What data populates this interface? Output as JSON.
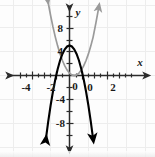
{
  "figure": {
    "name": "coordinate-plane-two-parabolas",
    "background_color": "#fdfdfd",
    "grid_color": "#ededed",
    "axis_color": "#2b2b2b"
  },
  "axis_labels": {
    "x": "x",
    "y": "y",
    "origin": "0"
  },
  "chart_data": {
    "type": "line",
    "title": "",
    "subtitle": "",
    "xlabel": "x",
    "ylabel": "y",
    "xlim": [
      -6,
      6
    ],
    "ylim": [
      -11,
      11
    ],
    "grid": true,
    "legend": "none",
    "x_ticks": [
      -4,
      -2,
      0,
      2,
      4
    ],
    "x_tick_labels": [
      "-4",
      "-2",
      "0",
      "2",
      "4"
    ],
    "y_ticks": [
      -8,
      -4,
      4,
      8
    ],
    "y_tick_labels": [
      "-8",
      "-4",
      "4",
      "8"
    ],
    "x_tick_interval": 1,
    "y_tick_interval": 2,
    "series": [
      {
        "name": "downward-parabola",
        "color": "#000000",
        "stroke_width": 2.1,
        "equation": "y = -2.5x^2 + 5",
        "vertex": [
          0,
          5
        ],
        "opens": "down",
        "roots": [
          -1.41,
          1.41
        ],
        "arrows": [
          "start",
          "end"
        ],
        "x": [
          -2.5,
          -2.25,
          -2,
          -1.75,
          -1.5,
          -1.25,
          -1,
          -0.75,
          -0.5,
          -0.25,
          0,
          0.25,
          0.5,
          0.75,
          1,
          1.25,
          1.5,
          1.75,
          2,
          2.25,
          2.5
        ],
        "y": [
          -10.6,
          -7.66,
          -5,
          -2.66,
          -0.63,
          1.09,
          2.5,
          3.59,
          4.38,
          4.84,
          5,
          4.84,
          4.38,
          3.59,
          2.5,
          1.09,
          -0.63,
          -2.66,
          -5,
          -7.66,
          -10.6
        ]
      },
      {
        "name": "upward-parabola",
        "color": "#9a9a9a",
        "stroke_width": 1.7,
        "equation": "y = 1.6(x - 0.5)^2",
        "vertex": [
          0.5,
          0
        ],
        "opens": "up",
        "roots": [
          0.5
        ],
        "arrows": [
          "start",
          "end"
        ],
        "x": [
          -2.3,
          -2,
          -1.75,
          -1.5,
          -1.25,
          -1,
          -0.75,
          -0.5,
          -0.25,
          0,
          0.25,
          0.5,
          0.75,
          1,
          1.25,
          1.5,
          1.75,
          2,
          2.25,
          2.5,
          2.8,
          3.1
        ],
        "y": [
          12.5,
          10,
          8.1,
          6.4,
          4.9,
          3.6,
          2.5,
          1.6,
          0.9,
          0.4,
          0.1,
          0,
          0.1,
          0.4,
          0.9,
          1.6,
          2.5,
          3.6,
          4.9,
          6.4,
          8.8,
          11.4
        ]
      }
    ]
  }
}
